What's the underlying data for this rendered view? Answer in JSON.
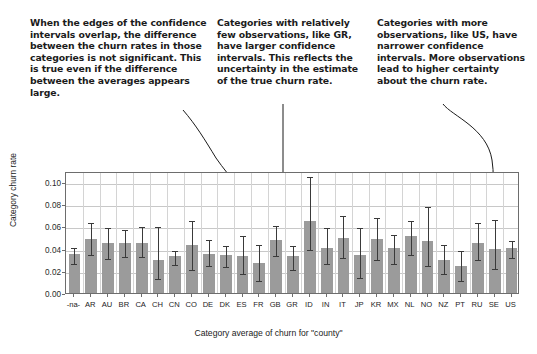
{
  "annotations": [
    {
      "id": "ann-overlap",
      "text": "When the edges of the confidence intervals overlap, the difference between the churn rates in those categories is not significant. This is true even if the difference between the averages appears large."
    },
    {
      "id": "ann-few-obs",
      "text": "Categories with relatively few observations, like GR, have larger confidence intervals. This reflects the uncertainty in the estimate of the true churn rate."
    },
    {
      "id": "ann-more-obs",
      "text": "Categories with more observations, like US, have narrower confidence intervals. More observations lead to higher certainty about the churn rate."
    }
  ],
  "colors": {
    "bar_fill": "#9b9b9b",
    "error_bar": "#3a3a3a",
    "grid": "#c8c8c8",
    "frame": "#6d6d6d",
    "text": "#1b1b1b"
  },
  "chart_data": {
    "type": "bar",
    "title": "",
    "subtitle": "",
    "xlabel": "Category average of churn for \"county\"",
    "ylabel": "Category churn rate",
    "ylim": [
      0.0,
      0.11
    ],
    "yticks": [
      0.0,
      0.02,
      0.04,
      0.06,
      0.08,
      0.1
    ],
    "ytick_labels": [
      "0.00",
      "0.02",
      "0.04",
      "0.06",
      "0.08",
      "0.10"
    ],
    "grid": true,
    "legend": null,
    "error_bars": "95% confidence intervals",
    "categories": [
      "-na-",
      "AR",
      "AU",
      "BR",
      "CA",
      "CH",
      "CN",
      "CO",
      "DE",
      "DK",
      "ES",
      "FR",
      "GB",
      "GR",
      "ID",
      "IN",
      "IT",
      "JP",
      "KR",
      "MX",
      "NL",
      "NO",
      "NZ",
      "PT",
      "RU",
      "SE",
      "US"
    ],
    "values": [
      0.035,
      0.049,
      0.045,
      0.045,
      0.0455,
      0.0295,
      0.0335,
      0.043,
      0.035,
      0.034,
      0.0335,
      0.0275,
      0.0475,
      0.033,
      0.065,
      0.041,
      0.0495,
      0.0345,
      0.0485,
      0.0405,
      0.051,
      0.0465,
      0.03,
      0.024,
      0.045,
      0.0395,
      0.041
    ],
    "ci_lower": [
      0.028,
      0.0365,
      0.0325,
      0.0345,
      0.0345,
      0.0145,
      0.027,
      0.0225,
      0.026,
      0.025,
      0.019,
      0.0125,
      0.035,
      0.0225,
      0.0405,
      0.028,
      0.033,
      0.0155,
      0.0315,
      0.028,
      0.0365,
      0.0265,
      0.0185,
      0.0125,
      0.0315,
      0.023,
      0.033
    ],
    "ci_upper": [
      0.042,
      0.065,
      0.06,
      0.0585,
      0.061,
      0.061,
      0.04,
      0.067,
      0.0495,
      0.044,
      0.053,
      0.045,
      0.0625,
      0.0445,
      0.106,
      0.0605,
      0.0715,
      0.06,
      0.069,
      0.0545,
      0.0665,
      0.079,
      0.0455,
      0.04,
      0.065,
      0.068,
      0.049
    ]
  }
}
